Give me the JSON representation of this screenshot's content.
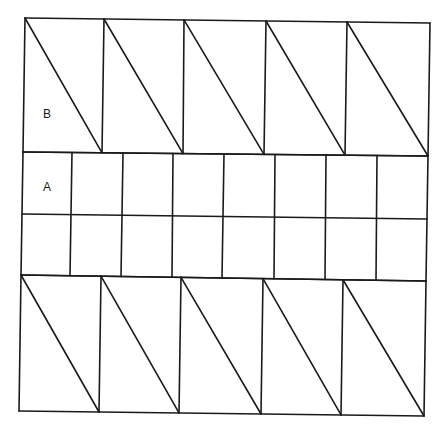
{
  "diagram": {
    "background": "#ffffff",
    "stroke_color": "#1a1a1a",
    "labels": [
      {
        "id": "B",
        "text": "B",
        "x": 43,
        "y": 118
      },
      {
        "id": "A",
        "text": "A",
        "x": 43,
        "y": 191
      }
    ],
    "top_band": {
      "description": "5 rectangles each split by a diagonal from top-left to bottom-right (triangles B)",
      "top_y_left": 18,
      "top_y_right": 23,
      "bottom_y_left": 152,
      "bottom_y_right": 156,
      "top_x": [
        25,
        104,
        184,
        266,
        347,
        430
      ],
      "bottom_x": [
        23,
        102,
        183,
        264,
        345,
        428
      ]
    },
    "middle_band": {
      "description": "2 rows x 8 columns of rectangles (A)",
      "rows_y_left": [
        152,
        214,
        275
      ],
      "rows_y_right": [
        156,
        219,
        281
      ],
      "top_x": [
        23,
        72,
        123,
        173,
        224,
        275,
        326,
        377,
        428
      ],
      "bottom_x": [
        21,
        70,
        121,
        172,
        222,
        274,
        325,
        376,
        426
      ]
    },
    "bottom_band": {
      "description": "5 rectangles each split by a diagonal from top-left to bottom-right",
      "top_y_left": 275,
      "top_y_right": 281,
      "bottom_y_left": 411,
      "bottom_y_right": 416,
      "top_x": [
        21,
        101,
        181,
        263,
        343,
        426
      ],
      "bottom_x": [
        19,
        99,
        179,
        261,
        341,
        424
      ]
    }
  }
}
